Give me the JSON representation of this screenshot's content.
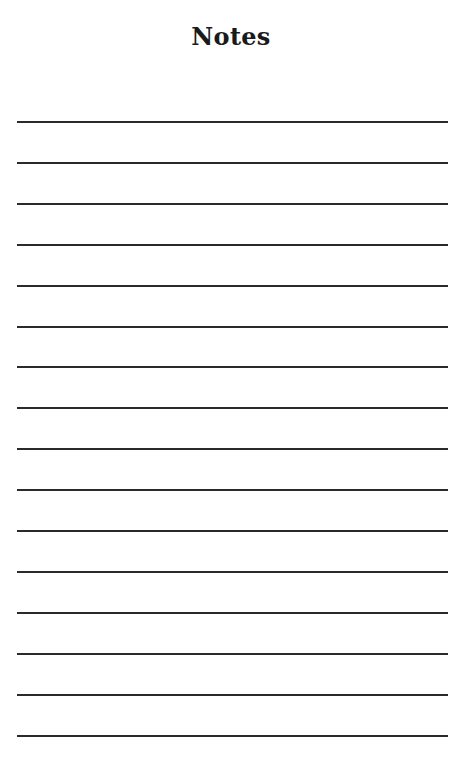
{
  "page": {
    "title": "Notes",
    "line_color": "#2a2a2a",
    "line_count": 16,
    "first_line_y": 121,
    "line_spacing": 40.9
  }
}
